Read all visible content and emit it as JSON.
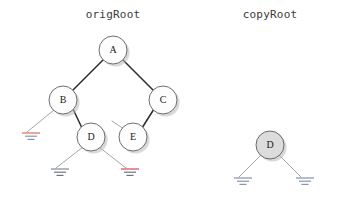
{
  "diagram": {
    "title_left": "origRoot",
    "title_right": "copyRoot",
    "background": "#ffffff",
    "node_fill_plain": "#fdfdfd",
    "node_fill_shaded": "#dcdcdc",
    "node_stroke": "#4a4a4a",
    "edge_strong_color": "#2b2b2b",
    "edge_thin_color": "#9a9a9a",
    "shadow_color": "#b9b9b9"
  },
  "orig_tree": {
    "label": "origRoot",
    "label_x": 113,
    "label_y": 18,
    "nodes": [
      {
        "id": "A",
        "letter": "A",
        "cx": 113,
        "cy": 50,
        "r": 14,
        "fill": "#fdfdfd"
      },
      {
        "id": "B",
        "letter": "B",
        "cx": 63,
        "cy": 100,
        "r": 14,
        "fill": "#fdfdfd"
      },
      {
        "id": "C",
        "letter": "C",
        "cx": 163,
        "cy": 100,
        "r": 14,
        "fill": "#fdfdfd"
      },
      {
        "id": "D",
        "letter": "D",
        "cx": 91,
        "cy": 137,
        "r": 14,
        "fill": "#fdfdfd"
      },
      {
        "id": "E",
        "letter": "E",
        "cx": 133,
        "cy": 137,
        "r": 14,
        "fill": "#fdfdfd"
      }
    ],
    "edges": [
      {
        "from": "A",
        "to": "B",
        "weight": "strong",
        "x1": 103,
        "y1": 60,
        "x2": 72,
        "y2": 91
      },
      {
        "from": "A",
        "to": "C",
        "weight": "strong",
        "x1": 123,
        "y1": 60,
        "x2": 154,
        "y2": 91
      },
      {
        "from": "B",
        "to": "D",
        "weight": "strong",
        "x1": 73,
        "y1": 109,
        "x2": 82,
        "y2": 128
      },
      {
        "from": "C",
        "to": "E",
        "weight": "strong",
        "x1": 154,
        "y1": 109,
        "x2": 142,
        "y2": 128
      },
      {
        "from": "B",
        "to": "null-left",
        "weight": "thin",
        "x1": 54,
        "y1": 110,
        "x2": 27,
        "y2": 132
      },
      {
        "from": "D",
        "to": "null-left",
        "weight": "thin",
        "x1": 83,
        "y1": 147,
        "x2": 56,
        "y2": 168
      },
      {
        "from": "D",
        "to": "null-right",
        "weight": "thin",
        "x1": 99,
        "y1": 147,
        "x2": 126,
        "y2": 168
      },
      {
        "from": "E",
        "to": "null-left",
        "weight": "thin",
        "x1": 124,
        "y1": 129,
        "x2": 112,
        "y2": 121
      }
    ],
    "grounds": [
      {
        "id": "g-b-left",
        "x": 22,
        "y": 133,
        "top_color": "#e08a7a",
        "line_color": "#8b93a8"
      },
      {
        "id": "g-d-left",
        "x": 51,
        "y": 169,
        "top_color": "#9aa0a8",
        "line_color": "#6e737d"
      },
      {
        "id": "g-d-right",
        "x": 121,
        "y": 169,
        "top_color": "#e06a7a",
        "line_color": "#6e737d"
      }
    ]
  },
  "copy_tree": {
    "label": "copyRoot",
    "label_x": 270,
    "label_y": 18,
    "nodes": [
      {
        "id": "Dcopy",
        "letter": "D",
        "cx": 270,
        "cy": 145,
        "r": 14,
        "fill": "#dcdcdc"
      }
    ],
    "edges": [
      {
        "from": "Dcopy",
        "to": "null-left",
        "weight": "thin",
        "x1": 261,
        "y1": 155,
        "x2": 239,
        "y2": 177
      },
      {
        "from": "Dcopy",
        "to": "null-right",
        "weight": "thin",
        "x1": 279,
        "y1": 155,
        "x2": 301,
        "y2": 177
      }
    ],
    "grounds": [
      {
        "id": "g-copy-left",
        "x": 234,
        "y": 178,
        "top_color": "#9aa6c4",
        "line_color": "#8b93a8"
      },
      {
        "id": "g-copy-right",
        "x": 296,
        "y": 178,
        "top_color": "#9aa6c4",
        "line_color": "#8b93a8"
      }
    ]
  }
}
